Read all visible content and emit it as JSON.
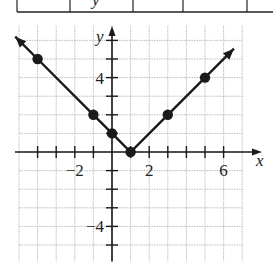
{
  "table_strip": {
    "cells": [
      "",
      "y",
      "",
      "",
      ""
    ],
    "note": "partial table row clipped at top"
  },
  "chart_data": {
    "type": "line",
    "title": "",
    "function": "y = |x - 1|",
    "xlabel": "x",
    "ylabel": "y",
    "xlim": [
      -5,
      7
    ],
    "ylim": [
      -6,
      7
    ],
    "grid": true,
    "x_tick_labels": [
      "-2",
      "2",
      "6"
    ],
    "x_tick_label_values": [
      -2,
      2,
      6
    ],
    "y_tick_labels": [
      "4",
      "-4"
    ],
    "y_tick_label_values": [
      4,
      -4
    ],
    "series": [
      {
        "name": "y = |x - 1|",
        "points": [
          [
            -4,
            5
          ],
          [
            -1,
            2
          ],
          [
            0,
            1
          ],
          [
            1,
            0
          ],
          [
            3,
            2
          ],
          [
            5,
            4
          ]
        ],
        "arrows_at_ends": true,
        "color": "#1a1a1a"
      }
    ]
  },
  "colors": {
    "grid": "#bdbdbd",
    "axis": "#1a1a1a",
    "line": "#1a1a1a",
    "points": "#1a1a1a"
  }
}
